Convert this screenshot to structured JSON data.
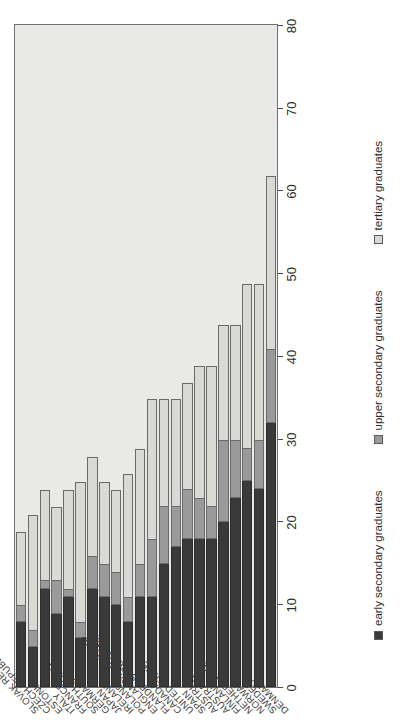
{
  "chart_data": {
    "type": "bar",
    "orientation": "horizontal-rotated",
    "stacked": true,
    "title": "",
    "subtitle": "",
    "xlabel": "",
    "ylabel": "",
    "ylim": [
      0,
      80
    ],
    "grid": false,
    "legend_position": "bottom",
    "tick_labels": [
      "0",
      "10",
      "20",
      "30",
      "40",
      "50",
      "60",
      "70",
      "80"
    ],
    "ticks": [
      0,
      10,
      20,
      30,
      40,
      50,
      60,
      70,
      80
    ],
    "categories": [
      "DENMARK",
      "SWEDEN",
      "NORWAY",
      "NETHERLANDS",
      "FINLAND",
      "AUSTRALIA",
      "AUSTRIA",
      "SPAIN",
      "UNITED STATES",
      "CANADA",
      "FLANDERS (BELGIUM)",
      "ENGLAND/N. IRELAND",
      "POLAND",
      "IRELAND",
      "JAPAN",
      "GERMANY",
      "SOUTH KOREA",
      "FRANCE",
      "ITALY",
      "ESTONIA",
      "CZECH REPUBLIC",
      "SLOVAK REPUBLIC"
    ],
    "series": [
      {
        "name": "early secondary graduates",
        "color": "#3a3a3a",
        "values": [
          32,
          24,
          25,
          23,
          20,
          18,
          18,
          18,
          17,
          15,
          11,
          11,
          8,
          10,
          11,
          12,
          6,
          11,
          9,
          12,
          5,
          8
        ]
      },
      {
        "name": "upper secondary graduates",
        "color": "#9a9a9a",
        "values": [
          9,
          6,
          4,
          7,
          10,
          4,
          5,
          6,
          5,
          7,
          7,
          4,
          3,
          4,
          4,
          4,
          2,
          1,
          4,
          1,
          2,
          2
        ]
      },
      {
        "name": "tertiary graduates",
        "color": "#d9d9d6",
        "values": [
          21,
          19,
          20,
          14,
          14,
          17,
          16,
          13,
          13,
          13,
          17,
          14,
          15,
          10,
          10,
          12,
          17,
          12,
          9,
          11,
          14,
          9
        ]
      }
    ]
  },
  "legend": {
    "items": [
      {
        "label": "early secondary graduates",
        "swatch": "s0"
      },
      {
        "label": "upper secondary graduates",
        "swatch": "s1"
      },
      {
        "label": "tertiary graduates",
        "swatch": "s2"
      }
    ]
  }
}
